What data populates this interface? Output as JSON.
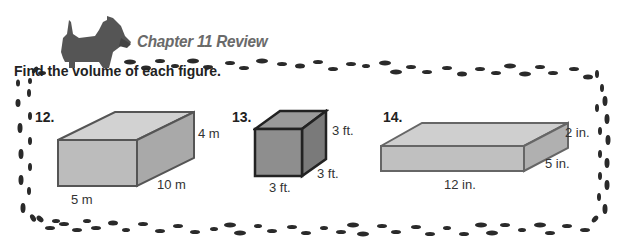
{
  "header": {
    "title": "Chapter 11 Review",
    "mascot": "scottie-dog"
  },
  "instructions": "Find the volume of each figure.",
  "problems": [
    {
      "number": "12.",
      "shape": "rectangular-prism",
      "labels": {
        "height": "4 m",
        "depth": "10 m",
        "width": "5 m"
      }
    },
    {
      "number": "13.",
      "shape": "cube",
      "labels": {
        "height": "3 ft.",
        "depth": "3 ft.",
        "width": "3 ft."
      }
    },
    {
      "number": "14.",
      "shape": "rectangular-prism",
      "labels": {
        "height": "2 in.",
        "depth": "5 in.",
        "width": "12 in."
      }
    }
  ],
  "colors": {
    "footprints": "#2a2a2a",
    "prism_front": "#b8b8b8",
    "prism_side": "#a0a0a0",
    "prism_top": "#d4d4d4",
    "cube_front": "#8a8a8a",
    "title": "#6a6a6a"
  }
}
